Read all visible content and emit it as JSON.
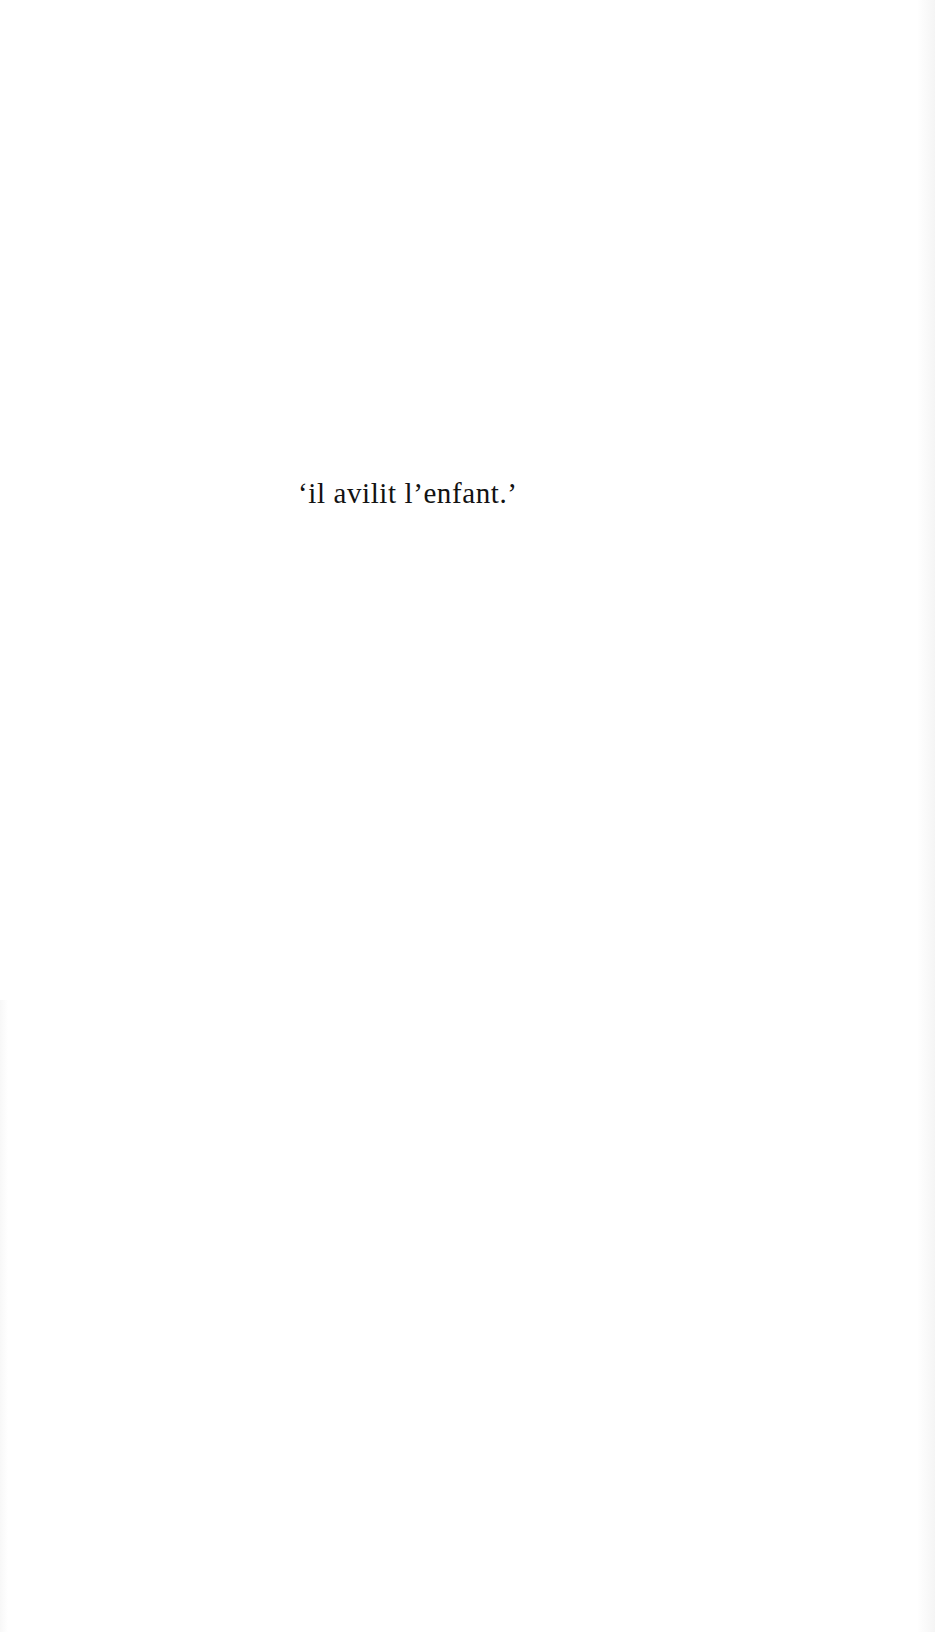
{
  "page": {
    "background": "#ffffff",
    "text_color": "#121212"
  },
  "epigraph": {
    "text": "‘il avilit l’enfant.’"
  }
}
